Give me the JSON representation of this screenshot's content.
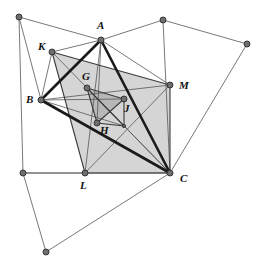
{
  "figure": {
    "background_color": "#ffffff",
    "width": 259,
    "height": 267
  },
  "style": {
    "bold_stroke_color": "#1a1a1a",
    "bold_stroke_width": 2.6,
    "medium_stroke_color": "#3a3a3a",
    "medium_stroke_width": 1.1,
    "thin_stroke_color": "#555555",
    "thin_stroke_width": 0.8,
    "shade_fill_outer": "#d5d5d5",
    "shade_fill_inner": "#b8b8b8",
    "node_fill": "#6e6e6e",
    "node_stroke": "#2b2b2b",
    "node_radius": 3.0,
    "small_node_radius": 1.6,
    "label_color": "#111111"
  },
  "points": {
    "A": {
      "label": "A",
      "x": 101,
      "y": 40,
      "lx": 97,
      "ly": 29,
      "dot": true,
      "size": "large"
    },
    "B": {
      "label": "B",
      "x": 41,
      "y": 100,
      "lx": 26,
      "ly": 103,
      "dot": true,
      "size": "large"
    },
    "C": {
      "label": "C",
      "x": 170,
      "y": 173,
      "lx": 180,
      "ly": 182,
      "dot": true,
      "size": "large"
    },
    "K": {
      "label": "K",
      "x": 52,
      "y": 52,
      "lx": 38,
      "ly": 50,
      "dot": true,
      "size": "large"
    },
    "L": {
      "label": "L",
      "x": 85,
      "y": 173,
      "lx": 80,
      "ly": 189,
      "dot": true,
      "size": "large"
    },
    "M": {
      "label": "M",
      "x": 170,
      "y": 85,
      "lx": 179,
      "ly": 89,
      "dot": true,
      "size": "large"
    },
    "G": {
      "label": "G",
      "x": 87,
      "y": 88,
      "lx": 82,
      "ly": 80,
      "dot": true,
      "size": "large"
    },
    "H": {
      "label": "H",
      "x": 97,
      "y": 123,
      "lx": 100,
      "ly": 134,
      "dot": true,
      "size": "large"
    },
    "J": {
      "label": "J",
      "x": 124,
      "y": 99,
      "lx": 124,
      "ly": 112,
      "dot": true,
      "size": "large"
    },
    "P1": {
      "label": "",
      "x": 19,
      "y": 17,
      "lx": 0,
      "ly": 0,
      "dot": true,
      "size": "large"
    },
    "P2": {
      "label": "",
      "x": 163,
      "y": 20,
      "lx": 0,
      "ly": 0,
      "dot": true,
      "size": "large"
    },
    "P3": {
      "label": "",
      "x": 247,
      "y": 44,
      "lx": 0,
      "ly": 0,
      "dot": true,
      "size": "large"
    },
    "P4": {
      "label": "",
      "x": 23,
      "y": 173,
      "lx": 0,
      "ly": 0,
      "dot": true,
      "size": "large"
    },
    "P5": {
      "label": "",
      "x": 46,
      "y": 252,
      "lx": 0,
      "ly": 0,
      "dot": true,
      "size": "large"
    },
    "Q1": {
      "label": "",
      "x": 124,
      "y": 126,
      "lx": 0,
      "ly": 0,
      "dot": true,
      "size": "small"
    }
  },
  "shaded_regions": [
    {
      "name": "outer-shaded-quadrilateral",
      "fill": "#d5d5d5",
      "vertices": [
        [
          52,
          52
        ],
        [
          170,
          85
        ],
        [
          170,
          173
        ],
        [
          85,
          173
        ]
      ]
    },
    {
      "name": "inner-shaded-triangle",
      "fill": "#b8b8b8",
      "vertices": [
        [
          87,
          88
        ],
        [
          124,
          99
        ],
        [
          97,
          123
        ]
      ]
    }
  ],
  "bold_edges": [
    {
      "name": "edge-A-B",
      "from": "A",
      "to": "B"
    },
    {
      "name": "edge-B-C",
      "from": "B",
      "to": "C"
    },
    {
      "name": "edge-C-A",
      "from": "C",
      "to": "A"
    }
  ],
  "medium_edges": [
    {
      "name": "edge-K-M",
      "from": "K",
      "to": "M"
    },
    {
      "name": "edge-M-C",
      "from": "M",
      "to": "C"
    },
    {
      "name": "edge-C-L",
      "from": "C",
      "to": "L"
    },
    {
      "name": "edge-L-K",
      "from": "L",
      "to": "K"
    },
    {
      "name": "edge-G-J",
      "from": "G",
      "to": "J"
    },
    {
      "name": "edge-J-H",
      "from": "J",
      "to": "H"
    },
    {
      "name": "edge-H-G",
      "from": "H",
      "to": "G"
    },
    {
      "name": "edge-G-Q1",
      "from": "G",
      "to": "Q1"
    },
    {
      "name": "edge-Q1-J",
      "from": "Q1",
      "to": "J"
    },
    {
      "name": "edge-H-Q1",
      "from": "H",
      "to": "Q1"
    }
  ],
  "thin_edges": [
    {
      "name": "edge-P1-A",
      "from": "P1",
      "to": "A"
    },
    {
      "name": "edge-P1-B",
      "from": "P1",
      "to": "B"
    },
    {
      "name": "edge-P1-P4",
      "from": "P1",
      "to": "P4"
    },
    {
      "name": "edge-A-P2",
      "from": "A",
      "to": "P2"
    },
    {
      "name": "edge-P2-P3",
      "from": "P2",
      "to": "P3"
    },
    {
      "name": "edge-P2-C",
      "from": "P2",
      "to": "C"
    },
    {
      "name": "edge-P3-C",
      "from": "P3",
      "to": "C"
    },
    {
      "name": "edge-A-M",
      "from": "A",
      "to": "M"
    },
    {
      "name": "edge-A-K",
      "from": "A",
      "to": "K"
    },
    {
      "name": "edge-K-B",
      "from": "K",
      "to": "B"
    },
    {
      "name": "edge-P4-C",
      "from": "P4",
      "to": "C"
    },
    {
      "name": "edge-P4-L",
      "from": "P4",
      "to": "L"
    },
    {
      "name": "edge-P4-P5",
      "from": "P4",
      "to": "P5"
    },
    {
      "name": "edge-P5-C",
      "from": "P5",
      "to": "C"
    },
    {
      "name": "edge-B-M",
      "from": "B",
      "to": "M"
    },
    {
      "name": "edge-A-H",
      "from": "A",
      "to": "H"
    },
    {
      "name": "edge-B-J",
      "from": "B",
      "to": "J"
    },
    {
      "name": "edge-A-L",
      "from": "A",
      "to": "L"
    },
    {
      "name": "edge-K-C",
      "from": "K",
      "to": "C"
    },
    {
      "name": "edge-L-M",
      "from": "L",
      "to": "M"
    },
    {
      "name": "edge-B-Q1",
      "from": "B",
      "to": "Q1"
    },
    {
      "name": "edge-G-C",
      "from": "G",
      "to": "C"
    }
  ],
  "label_list": [
    "A",
    "B",
    "C",
    "K",
    "L",
    "M",
    "G",
    "H",
    "J"
  ]
}
